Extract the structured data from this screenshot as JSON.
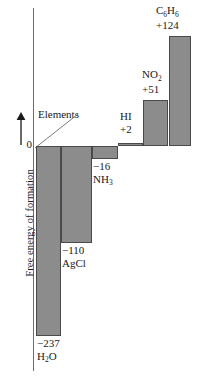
{
  "chart_data": {
    "type": "bar",
    "title": "",
    "subtitle": "",
    "xlabel": "",
    "ylabel": "Free energy of formation",
    "ylabel_arrow": "up-arrow",
    "zero_tick": "0",
    "baseline_annotation": "Elements",
    "grid": false,
    "legend": null,
    "categories": [
      "H2O",
      "AgCl",
      "NH3",
      "HI",
      "NO2",
      "C6H6"
    ],
    "values": [
      -237,
      -110,
      -16,
      2,
      51,
      124
    ],
    "value_labels": [
      "−237",
      "−110",
      "−16",
      "+2",
      "+51",
      "+124"
    ],
    "ylim": [
      -260,
      140
    ],
    "bars": [
      {
        "species": "H2O",
        "species_parts": [
          {
            "t": "H",
            "sub": false
          },
          {
            "t": "2",
            "sub": true
          },
          {
            "t": "O",
            "sub": false
          }
        ],
        "value": -237,
        "value_label": "−237",
        "x": 36,
        "width": 25,
        "top": 146,
        "height": 190,
        "label_left": 37,
        "label_top": 337
      },
      {
        "species": "AgCl",
        "species_parts": [
          {
            "t": "AgCl",
            "sub": false
          }
        ],
        "value": -110,
        "value_label": "−110",
        "x": 61,
        "width": 31,
        "top": 146,
        "height": 97,
        "label_left": 62,
        "label_top": 244
      },
      {
        "species": "NH3",
        "species_parts": [
          {
            "t": "NH",
            "sub": false
          },
          {
            "t": "3",
            "sub": true
          }
        ],
        "value": -16,
        "value_label": "−16",
        "x": 92,
        "width": 26,
        "top": 146,
        "height": 13,
        "label_left": 93,
        "label_top": 160
      },
      {
        "species": "HI",
        "species_parts": [
          {
            "t": "HI",
            "sub": false
          }
        ],
        "value": 2,
        "value_label": "+2",
        "x": 118,
        "width": 25,
        "top": 143,
        "height": 3,
        "label_left": 120,
        "label_top": 110
      },
      {
        "species": "NO2",
        "species_parts": [
          {
            "t": "NO",
            "sub": false
          },
          {
            "t": "2",
            "sub": true
          }
        ],
        "value": 51,
        "value_label": "+51",
        "x": 143,
        "width": 25,
        "top": 100,
        "height": 46,
        "label_left": 142,
        "label_top": 68
      },
      {
        "species": "C6H6",
        "species_parts": [
          {
            "t": "C",
            "sub": false
          },
          {
            "t": "6",
            "sub": true
          },
          {
            "t": "H",
            "sub": false
          },
          {
            "t": "6",
            "sub": true
          }
        ],
        "value": 124,
        "value_label": "+124",
        "x": 169,
        "width": 22,
        "top": 36,
        "height": 110,
        "label_left": 156,
        "label_top": 4
      }
    ],
    "colors": {
      "bar_fill": "#8c8c8c",
      "bar_stroke": "#4a4a4a",
      "axis": "#6e6e6e",
      "text": "#1a1a1a",
      "background": "#ffffff"
    }
  }
}
